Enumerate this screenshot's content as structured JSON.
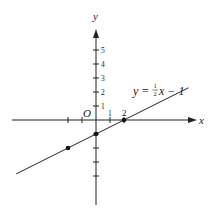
{
  "chart_data": {
    "type": "line",
    "title": "",
    "equation_label": {
      "prefix": "y = ",
      "numerator": "1",
      "denominator": "2",
      "suffix": "x − 1"
    },
    "xlabel": "x",
    "ylabel": "y",
    "origin_label": "O",
    "x_tick_labels": [
      {
        "value": 1,
        "text": "1"
      },
      {
        "value": 2,
        "text": "2"
      }
    ],
    "x_ticks": [
      -2,
      -1,
      1,
      2
    ],
    "y_tick_labels": [
      {
        "value": 1,
        "text": "1"
      },
      {
        "value": 2,
        "text": "2"
      },
      {
        "value": 3,
        "text": "3"
      },
      {
        "value": 4,
        "text": "4"
      },
      {
        "value": 5,
        "text": "5"
      }
    ],
    "y_ticks": [
      -4,
      -3,
      -2,
      -1,
      1,
      2,
      3,
      4,
      5
    ],
    "xlim": [
      -6,
      7.2
    ],
    "ylim": [
      -6.1,
      6.4
    ],
    "grid": false,
    "series": [
      {
        "name": "y = 1/2 x - 1",
        "slope": 0.5,
        "intercept": -1,
        "x_range": [
          -5.7,
          6.6
        ]
      }
    ],
    "points": [
      {
        "x": -2,
        "y": -2
      },
      {
        "x": 0,
        "y": -1
      },
      {
        "x": 2,
        "y": 0
      }
    ]
  },
  "colors": {
    "axis": "#222222",
    "line": "#222222",
    "point": "#111111",
    "background": "#ffffff"
  }
}
